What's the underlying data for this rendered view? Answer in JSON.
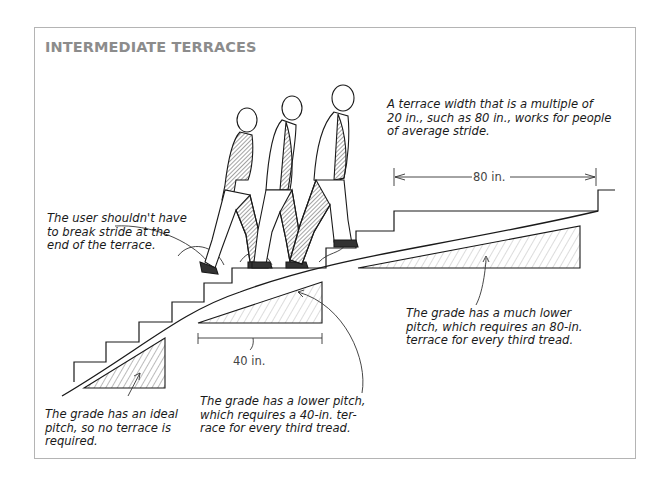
{
  "figure": {
    "title": "INTERMEDIATE TERRACES",
    "border_color": "#b4b4b4",
    "title_color": "#8c8c8c"
  },
  "annotations": {
    "top_right": "A terrace width that is a multiple of\n20 in., such as 80 in., works for people\nof average stride.",
    "stride": "The user shouldn't have\nto break stride at the\nend of the terrace.",
    "ideal_pitch": "The grade has an ideal\npitch, so no terrace is\nrequired.",
    "lower_pitch": "The grade has a lower pitch,\nwhich requires a 40-in. ter-\nrace for every third tread.",
    "much_lower_pitch": "The grade has a much lower\npitch, which requires an 80-in.\nterrace for every third tread."
  },
  "dimensions": {
    "terrace_80": "80 in.",
    "terrace_40": "40 in."
  },
  "illustration": {
    "figures": [
      "walking-person-1",
      "walking-person-2",
      "walking-person-3"
    ],
    "grade_triangles": [
      "ideal-pitch",
      "lower-pitch",
      "much-lower-pitch"
    ]
  }
}
